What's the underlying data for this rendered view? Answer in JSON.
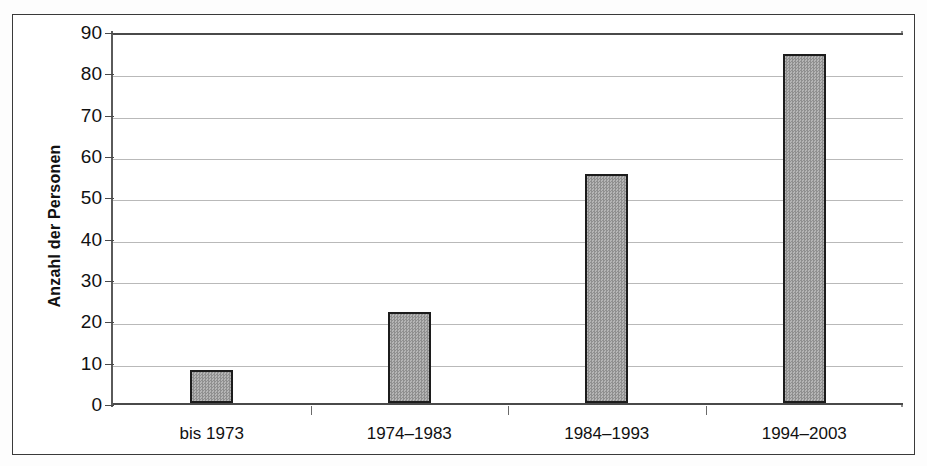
{
  "chart_data": {
    "type": "bar",
    "title": "",
    "subtitle": "",
    "xlabel": "",
    "ylabel": "Anzahl der Personen",
    "categories": [
      "bis 1973",
      "1974–1983",
      "1984–1993",
      "1994–2003"
    ],
    "values": [
      8,
      22,
      55.5,
      84.5
    ],
    "ylim": [
      0,
      90
    ],
    "ytick_labels": [
      "90",
      "80",
      "70",
      "60",
      "50",
      "40",
      "30",
      "20",
      "10",
      "0"
    ],
    "ytick_values": [
      90,
      80,
      70,
      60,
      50,
      40,
      30,
      20,
      10,
      0
    ],
    "ytick_step": 10,
    "grid": true,
    "grid_axis": "y",
    "legend": false,
    "legend_position": "none",
    "series": [
      {
        "name": "Anzahl der Personen",
        "values": [
          8,
          22,
          55.5,
          84.5
        ],
        "fill_color": "#9d9d9d",
        "edge_color": "#1c1c1c",
        "fill_pattern": "dither-gray"
      }
    ],
    "colors": {
      "bar_fill": "#9d9d9d",
      "bar_edge": "#1c1c1c",
      "gridline": "#b9b9b9",
      "axis": "#4a4a4a",
      "frame": "#3a3a3a",
      "background": "#ffffff",
      "text": "#111111"
    }
  }
}
